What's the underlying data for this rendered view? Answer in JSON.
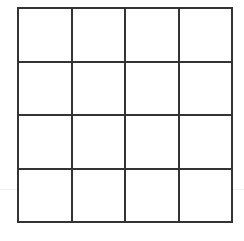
{
  "grid": {
    "rows": 4,
    "columns": 4,
    "line_color": "#333333",
    "background_color": "#ffffff",
    "cells": [
      [
        "",
        "",
        "",
        ""
      ],
      [
        "",
        "",
        "",
        ""
      ],
      [
        "",
        "",
        "",
        ""
      ],
      [
        "",
        "",
        "",
        ""
      ]
    ]
  }
}
